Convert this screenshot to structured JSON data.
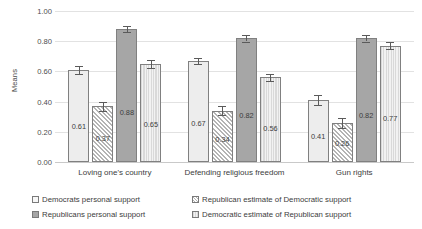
{
  "chart_data": {
    "type": "bar",
    "title": "",
    "xlabel": "",
    "ylabel": "Means",
    "ylim": [
      0,
      1.0
    ],
    "ytick_step": 0.2,
    "grid": true,
    "legend_position": "bottom",
    "categories": [
      "Loving one's country",
      "Defending religious freedom",
      "Gun rights"
    ],
    "yticks": [
      "0.00",
      "0.20",
      "0.40",
      "0.60",
      "0.80",
      "1.00"
    ],
    "series": [
      {
        "name": "Democrats personal support",
        "pattern": "solid-light",
        "values": [
          0.61,
          0.67,
          0.41
        ],
        "labels": [
          "0.61",
          "0.67",
          "0.41"
        ],
        "errors": [
          0.025,
          0.022,
          0.035
        ]
      },
      {
        "name": "Republican estimate of Democratic support",
        "pattern": "diagonal-hatch",
        "values": [
          0.37,
          0.34,
          0.26
        ],
        "labels": [
          "0.37",
          "0.34",
          "0.26"
        ],
        "errors": [
          0.03,
          0.028,
          0.032
        ]
      },
      {
        "name": "Republicans personal support",
        "pattern": "solid-dark",
        "values": [
          0.88,
          0.82,
          0.82
        ],
        "labels": [
          "0.88",
          "0.82",
          "0.82"
        ],
        "errors": [
          0.022,
          0.022,
          0.022
        ]
      },
      {
        "name": "Democratic estimate of Republican support",
        "pattern": "vertical-stripes",
        "values": [
          0.65,
          0.56,
          0.77
        ],
        "labels": [
          "0.65",
          "0.56",
          "0.77"
        ],
        "errors": [
          0.028,
          0.025,
          0.022
        ]
      }
    ],
    "colors": {
      "series1": "#ededed",
      "series2": "#b4b4b4",
      "series3": "#a6a6a6",
      "series4": "#d9d9d9",
      "bar_border": "#808080",
      "gridline": "#e2e2e2",
      "text": "#3d3d3d"
    }
  },
  "legend": {
    "items": [
      "Democrats personal support",
      "Republican estimate of Democratic support",
      "Republicans personal support",
      "Democratic estimate of Republican support"
    ]
  }
}
